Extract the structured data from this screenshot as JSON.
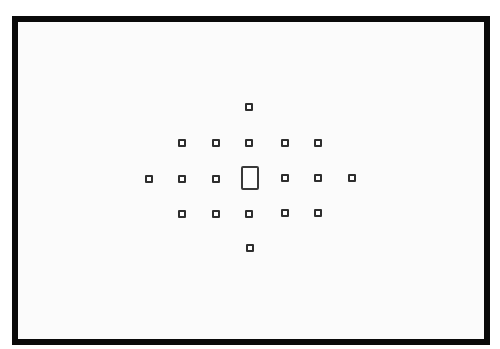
{
  "diagram": {
    "title": "",
    "frame": {
      "border_color": "#0a0a0a",
      "fill": "#fbfbfb"
    },
    "af_points": [
      {
        "id": "top",
        "x": 249,
        "y": 107
      },
      {
        "id": "r1c1",
        "x": 182,
        "y": 143
      },
      {
        "id": "r1c2",
        "x": 216,
        "y": 143
      },
      {
        "id": "r1c3",
        "x": 249,
        "y": 143
      },
      {
        "id": "r1c4",
        "x": 285,
        "y": 143
      },
      {
        "id": "r1c5",
        "x": 318,
        "y": 143
      },
      {
        "id": "r2c0",
        "x": 149,
        "y": 179
      },
      {
        "id": "r2c1",
        "x": 182,
        "y": 179
      },
      {
        "id": "r2c2",
        "x": 216,
        "y": 179
      },
      {
        "id": "r2c4",
        "x": 285,
        "y": 178
      },
      {
        "id": "r2c5",
        "x": 318,
        "y": 178
      },
      {
        "id": "r2c6",
        "x": 352,
        "y": 178
      },
      {
        "id": "r3c1",
        "x": 182,
        "y": 214
      },
      {
        "id": "r3c2",
        "x": 216,
        "y": 214
      },
      {
        "id": "r3c3",
        "x": 249,
        "y": 214
      },
      {
        "id": "r3c4",
        "x": 285,
        "y": 213
      },
      {
        "id": "r3c5",
        "x": 318,
        "y": 213
      },
      {
        "id": "bottom",
        "x": 250,
        "y": 248
      }
    ],
    "center_point": {
      "id": "center",
      "x": 250,
      "y": 178,
      "shape": "rectangle"
    },
    "point_color": "#2e2e2e"
  }
}
